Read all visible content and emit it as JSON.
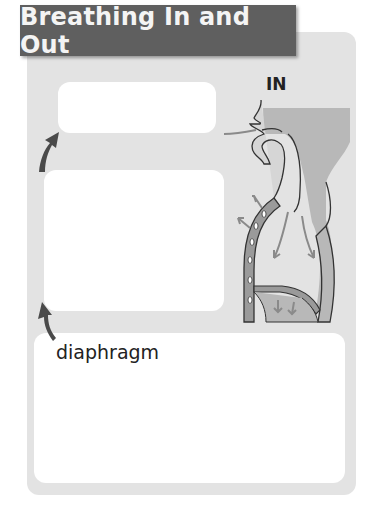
{
  "title": "Breathing In and Out",
  "diagram": {
    "state_label": "IN",
    "label_diaphragm": "diaphragm",
    "icons": {
      "pointer_arrow_top": "curved-arrow-up-icon",
      "pointer_arrow_bottom": "curved-arrow-up-icon",
      "airflow_arrows": "arrow-icon"
    },
    "answer_boxes": [
      {
        "id": "top",
        "text": ""
      },
      {
        "id": "middle",
        "text": ""
      },
      {
        "id": "bottom",
        "text": ""
      }
    ]
  },
  "colors": {
    "title_bg": "#5f5f5f",
    "title_text": "#f4f4f4",
    "panel_bg": "#e3e3e3",
    "box_bg": "#ffffff",
    "arrow_dark": "#4a4a4a",
    "body_fill": "#b8b8b8",
    "airflow_arrow": "#8a8a8a"
  }
}
